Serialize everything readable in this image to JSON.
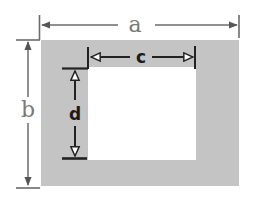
{
  "diagram": {
    "colors": {
      "frame_fill": "#c4c4c4",
      "opening_fill": "#ffffff",
      "outer_dimension_line": "#6b6b6b",
      "inner_dimension_line": "#222222"
    },
    "labels": {
      "outer_width": "a",
      "outer_height": "b",
      "inner_width": "c",
      "inner_height": "d"
    }
  }
}
